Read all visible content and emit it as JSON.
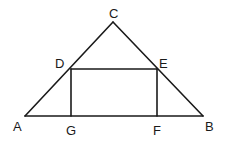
{
  "diagram": {
    "type": "geometry",
    "points": {
      "A": {
        "label": "A",
        "x": 25,
        "y": 116
      },
      "B": {
        "label": "B",
        "x": 203,
        "y": 116
      },
      "C": {
        "label": "C",
        "x": 113,
        "y": 22
      },
      "D": {
        "label": "D",
        "x": 71,
        "y": 69
      },
      "E": {
        "label": "E",
        "x": 157,
        "y": 69
      },
      "F": {
        "label": "F",
        "x": 157,
        "y": 116
      },
      "G": {
        "label": "G",
        "x": 71,
        "y": 116
      }
    },
    "segments": [
      "AC",
      "CB",
      "AB",
      "DE",
      "DG",
      "EF"
    ],
    "stroke_color": "#1a1a1a",
    "background": "#ffffff"
  }
}
